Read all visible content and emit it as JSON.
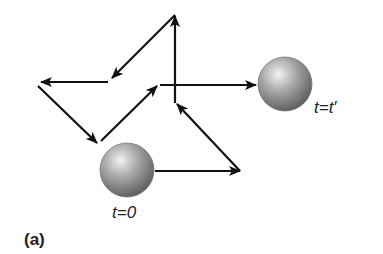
{
  "figure": {
    "panel_label": "(a)",
    "start_label": "t=0",
    "end_label": "t=t′"
  },
  "colors": {
    "arrow": "#111111",
    "sphere_light": "#e8e8e8",
    "sphere_dark": "#6a6a6a",
    "background": "#ffffff"
  },
  "path": {
    "segments": [
      {
        "from": [
          155,
          171
        ],
        "to": [
          240,
          171
        ]
      },
      {
        "from": [
          240,
          171
        ],
        "to": [
          177,
          103
        ]
      },
      {
        "from": [
          175,
          103
        ],
        "to": [
          175,
          15
        ]
      },
      {
        "from": [
          175,
          15
        ],
        "to": [
          112,
          78
        ]
      },
      {
        "from": [
          108,
          82
        ],
        "to": [
          40,
          82
        ]
      },
      {
        "from": [
          38,
          86
        ],
        "to": [
          97,
          143
        ]
      },
      {
        "from": [
          101,
          141
        ],
        "to": [
          158,
          85
        ]
      },
      {
        "from": [
          160,
          85
        ],
        "to": [
          255,
          85
        ]
      }
    ]
  },
  "spheres": [
    {
      "name": "start",
      "cx": 127,
      "cy": 170,
      "r": 27
    },
    {
      "name": "end",
      "cx": 285,
      "cy": 84,
      "r": 27
    }
  ]
}
